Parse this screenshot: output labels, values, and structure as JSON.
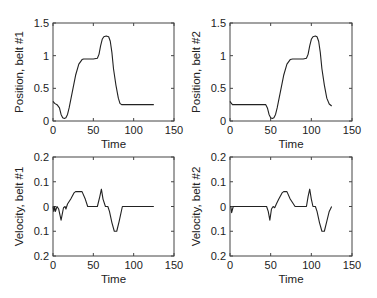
{
  "chart_data": [
    {
      "id": "pos1",
      "type": "line",
      "title": "",
      "xlabel": "Time",
      "ylabel": "Position, belt #1",
      "xlim": [
        0,
        150
      ],
      "ylim": [
        0,
        1.5
      ],
      "xticks": [
        0,
        50,
        100,
        150
      ],
      "xtick_labels": [
        "0",
        "50",
        "100",
        "150"
      ],
      "yticks": [
        0,
        0.5,
        1,
        1.5
      ],
      "ytick_labels": [
        "0",
        "0.5",
        "1",
        "1.5"
      ],
      "grid": false,
      "series": [
        {
          "name": "position belt 1",
          "x": [
            0,
            2,
            5,
            8,
            10,
            12,
            14,
            16,
            18,
            20,
            24,
            28,
            32,
            36,
            38,
            40,
            45,
            50,
            55,
            57,
            59,
            61,
            63,
            66,
            69,
            71,
            73,
            75,
            78,
            81,
            83,
            85,
            90,
            100,
            110,
            125
          ],
          "y": [
            0.3,
            0.27,
            0.25,
            0.2,
            0.1,
            0.05,
            0.04,
            0.05,
            0.1,
            0.2,
            0.45,
            0.7,
            0.87,
            0.94,
            0.95,
            0.95,
            0.95,
            0.95,
            0.96,
            1.02,
            1.15,
            1.25,
            1.29,
            1.3,
            1.29,
            1.22,
            1.05,
            0.8,
            0.55,
            0.35,
            0.27,
            0.25,
            0.25,
            0.25,
            0.25,
            0.25
          ]
        }
      ]
    },
    {
      "id": "pos2",
      "type": "line",
      "title": "",
      "xlabel": "Time",
      "ylabel": "Position, belt #2",
      "xlim": [
        0,
        150
      ],
      "ylim": [
        0,
        1.5
      ],
      "xticks": [
        0,
        50,
        100,
        150
      ],
      "xtick_labels": [
        "0",
        "50",
        "100",
        "150"
      ],
      "yticks": [
        0,
        0.5,
        1,
        1.5
      ],
      "ytick_labels": [
        "0",
        "0.5",
        "1",
        "1.5"
      ],
      "grid": false,
      "series": [
        {
          "name": "position belt 2",
          "x": [
            0,
            1,
            3,
            10,
            20,
            30,
            40,
            44,
            46,
            48,
            50,
            52,
            54,
            56,
            58,
            62,
            66,
            70,
            74,
            77,
            80,
            85,
            90,
            94,
            96,
            98,
            100,
            102,
            105,
            107,
            109,
            111,
            113,
            116,
            119,
            122,
            125
          ],
          "y": [
            0.3,
            0.28,
            0.25,
            0.25,
            0.25,
            0.25,
            0.25,
            0.25,
            0.2,
            0.1,
            0.05,
            0.04,
            0.05,
            0.1,
            0.2,
            0.45,
            0.7,
            0.87,
            0.94,
            0.95,
            0.95,
            0.95,
            0.95,
            0.96,
            1.02,
            1.15,
            1.25,
            1.29,
            1.3,
            1.29,
            1.22,
            1.05,
            0.8,
            0.55,
            0.35,
            0.26,
            0.23
          ]
        }
      ]
    },
    {
      "id": "vel1",
      "type": "line",
      "title": "",
      "xlabel": "Time",
      "ylabel": "Velocity, belt #1",
      "xlim": [
        0,
        150
      ],
      "ylim": [
        -0.2,
        0.2
      ],
      "xticks": [
        0,
        50,
        100,
        150
      ],
      "xtick_labels": [
        "0",
        "50",
        "100",
        "150"
      ],
      "yticks": [
        0.2,
        0.1,
        0,
        -0.1,
        -0.2
      ],
      "ytick_labels": [
        "0.2",
        "0.1",
        "0",
        "0.1",
        "0.2"
      ],
      "grid": false,
      "series": [
        {
          "name": "velocity belt 1",
          "x": [
            0,
            1,
            2,
            3,
            5,
            7,
            10,
            13,
            15,
            16,
            18,
            22,
            26,
            28,
            32,
            36,
            40,
            43,
            50,
            55,
            58,
            60,
            62,
            65,
            68,
            70,
            73,
            76,
            79,
            82,
            86,
            90,
            100,
            110,
            125
          ],
          "y": [
            0,
            -0.02,
            0.0,
            -0.02,
            0.0,
            -0.01,
            -0.055,
            -0.005,
            0.0,
            -0.01,
            0.01,
            0.03,
            0.055,
            0.06,
            0.06,
            0.06,
            0.03,
            0.0,
            0.0,
            0.0,
            0.04,
            0.07,
            0.03,
            0.0,
            0.0,
            -0.02,
            -0.065,
            -0.1,
            -0.1,
            -0.06,
            0.0,
            0.0,
            0.0,
            0.0,
            0.0
          ]
        }
      ]
    },
    {
      "id": "vel2",
      "type": "line",
      "title": "",
      "xlabel": "Time",
      "ylabel": "Velocity, belt #2",
      "xlim": [
        0,
        150
      ],
      "ylim": [
        -0.2,
        0.2
      ],
      "xticks": [
        0,
        50,
        100,
        150
      ],
      "xtick_labels": [
        "0",
        "50",
        "100",
        "150"
      ],
      "yticks": [
        0.2,
        0.1,
        0,
        -0.1,
        -0.2
      ],
      "ytick_labels": [
        "0.2",
        "0.1",
        "0",
        "0.1",
        "0.2"
      ],
      "grid": false,
      "series": [
        {
          "name": "velocity belt 2",
          "x": [
            0,
            1,
            2,
            4,
            10,
            20,
            30,
            40,
            45,
            47,
            49,
            51,
            53,
            55,
            57,
            60,
            64,
            66,
            70,
            74,
            80,
            85,
            90,
            94,
            96,
            98,
            100,
            102,
            105,
            107,
            110,
            113,
            116,
            119,
            122,
            125
          ],
          "y": [
            0,
            0.0,
            -0.025,
            0.0,
            0.0,
            0.0,
            0.0,
            0.0,
            0.0,
            -0.02,
            -0.055,
            -0.01,
            0.0,
            -0.005,
            0.01,
            0.03,
            0.055,
            0.06,
            0.06,
            0.03,
            0.0,
            0.0,
            0.0,
            0.0,
            0.04,
            0.07,
            0.03,
            0.0,
            0.0,
            -0.02,
            -0.065,
            -0.1,
            -0.1,
            -0.06,
            -0.02,
            0.0
          ]
        }
      ]
    }
  ],
  "layout": {
    "panels": [
      {
        "id": "pos1",
        "x0": 53,
        "y0": 23,
        "x1": 174,
        "y1": 121
      },
      {
        "id": "pos2",
        "x0": 230,
        "y0": 23,
        "x1": 352,
        "y1": 121
      },
      {
        "id": "vel1",
        "x0": 53,
        "y0": 157,
        "x1": 174,
        "y1": 256
      },
      {
        "id": "vel2",
        "x0": 230,
        "y0": 157,
        "x1": 352,
        "y1": 256
      }
    ]
  }
}
